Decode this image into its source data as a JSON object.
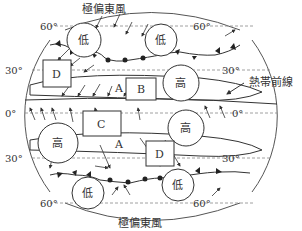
{
  "diagram": {
    "top_label": "極偏東風",
    "bottom_label": "極偏東風",
    "itcz_label": "熱帯前線",
    "latitudes": {
      "left": [
        "60°",
        "30°",
        "0°",
        "30°",
        "60°"
      ],
      "right": [
        "60°",
        "30°",
        "0°",
        "30°",
        "60°"
      ]
    },
    "pressure": {
      "low_nw": "低",
      "low_ne": "低",
      "high_ne": "高",
      "high_w": "高",
      "high_e": "高",
      "low_sw": "低",
      "low_se": "低"
    },
    "boxes": {
      "d_north": "D",
      "b": "B",
      "c": "C",
      "d_south": "D"
    },
    "points": {
      "a_north": "A",
      "a_south": "A"
    },
    "colors": {
      "line": "#333333",
      "dash": "#888888"
    }
  }
}
